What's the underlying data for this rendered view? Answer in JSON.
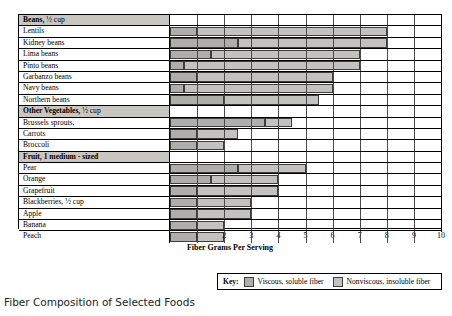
{
  "caption": "Fiber Composition of Selected Foods",
  "axis": {
    "xlabel": "Fiber Grams Per Serving",
    "ticks": [
      "1",
      "2",
      "3",
      "4",
      "5",
      "6",
      "7",
      "8",
      "9",
      "10"
    ]
  },
  "legend": {
    "key_label": "Key:",
    "items": [
      {
        "label": "Viscous, soluble fiber",
        "swatch": "sol",
        "color": "#b0aeab"
      },
      {
        "label": "Nonviscous, insoluble fiber",
        "swatch": "ins",
        "color": "#c4c2bf"
      }
    ]
  },
  "chart_data": {
    "type": "bar",
    "orientation": "horizontal",
    "stacked": true,
    "title": "Fiber Composition of Selected Foods",
    "xlabel": "Fiber Grams Per Serving",
    "ylabel": "",
    "xlim": [
      0,
      10
    ],
    "xticks": [
      1,
      2,
      3,
      4,
      5,
      6,
      7,
      8,
      9,
      10
    ],
    "grid": true,
    "legend_position": "bottom-right",
    "series": [
      {
        "name": "Viscous, soluble fiber",
        "color": "#b0aeab"
      },
      {
        "name": "Nonviscous, insoluble fiber",
        "color": "#c4c2bf"
      }
    ],
    "rows": [
      {
        "kind": "group",
        "label": "Beans,",
        "label_suffix": " ½ cup"
      },
      {
        "kind": "bar",
        "label": "Lentils",
        "soluble": 1.0,
        "insoluble": 7.0,
        "total": 8.0
      },
      {
        "kind": "bar",
        "label": "Kidney beans",
        "soluble": 2.5,
        "insoluble": 5.5,
        "total": 8.0
      },
      {
        "kind": "bar",
        "label": "Lima beans",
        "soluble": 1.5,
        "insoluble": 5.5,
        "total": 7.0
      },
      {
        "kind": "bar",
        "label": "Pinto beans",
        "soluble": 0.5,
        "insoluble": 6.5,
        "total": 7.0
      },
      {
        "kind": "bar",
        "label": "Garbanzo beans",
        "soluble": 1.0,
        "insoluble": 5.0,
        "total": 6.0
      },
      {
        "kind": "bar",
        "label": "Navy beans",
        "soluble": 0.5,
        "insoluble": 5.5,
        "total": 6.0
      },
      {
        "kind": "bar",
        "label": "Northern beans",
        "soluble": 2.0,
        "insoluble": 3.5,
        "total": 5.5
      },
      {
        "kind": "group",
        "label": "Other Vegetables,",
        "label_suffix": " ½ cup"
      },
      {
        "kind": "bar",
        "label": "Brussels sprouts,",
        "soluble": 3.5,
        "insoluble": 1.0,
        "total": 4.5
      },
      {
        "kind": "bar",
        "label": "Carrots",
        "soluble": 1.0,
        "insoluble": 1.5,
        "total": 2.5
      },
      {
        "kind": "bar",
        "label": "Broccoli",
        "soluble": 1.0,
        "insoluble": 1.0,
        "total": 2.0
      },
      {
        "kind": "group",
        "label": "Fruit, 1 medium - sized",
        "label_suffix": ""
      },
      {
        "kind": "bar",
        "label": "Pear",
        "soluble": 2.5,
        "insoluble": 2.5,
        "total": 5.0
      },
      {
        "kind": "bar",
        "label": "Orange",
        "soluble": 1.5,
        "insoluble": 2.5,
        "total": 4.0
      },
      {
        "kind": "bar",
        "label": "Grapefruit",
        "soluble": 1.0,
        "insoluble": 3.0,
        "total": 4.0
      },
      {
        "kind": "bar",
        "label": "Blackberries, ½ cup",
        "soluble": 1.0,
        "insoluble": 2.0,
        "total": 3.0
      },
      {
        "kind": "bar",
        "label": "Apple",
        "soluble": 1.0,
        "insoluble": 2.0,
        "total": 3.0
      },
      {
        "kind": "bar",
        "label": "Banana",
        "soluble": 1.0,
        "insoluble": 1.0,
        "total": 2.0
      },
      {
        "kind": "bar",
        "label": "Peach",
        "soluble": 1.0,
        "insoluble": 1.0,
        "total": 2.0
      }
    ]
  }
}
